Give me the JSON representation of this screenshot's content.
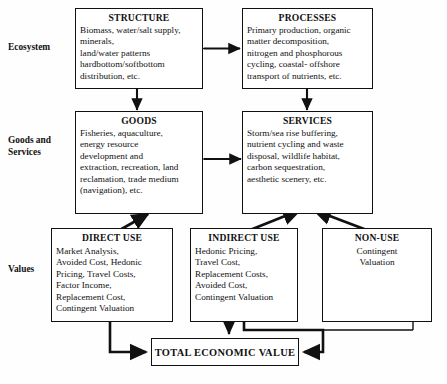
{
  "diagram": {
    "row_labels": [
      {
        "id": "ecosystem",
        "text": "Ecosystem"
      },
      {
        "id": "goods-and-services",
        "line1": "Goods and",
        "line2": "Services"
      },
      {
        "id": "values",
        "text": "Values"
      }
    ],
    "boxes": [
      {
        "id": "structure",
        "title": "STRUCTURE",
        "body": "Biomass, water/salt supply, minerals, land/water patterns hardbottom/softbottom distribution, etc.",
        "lines": [
          "Biomass, water/salt supply,",
          "minerals,",
          "land/water patterns",
          "hardbottom/softbottom",
          "distribution, etc."
        ],
        "align": "left"
      },
      {
        "id": "processes",
        "title": "PROCESSES",
        "body": "Primary production, organic matter decomposition, nitrogen and phosphorous cycling, coastal- offshore transport of nutrients, etc.",
        "lines": [
          "Primary production, organic",
          "matter decomposition,",
          "nitrogen and phosphorous",
          "cycling, coastal- offshore",
          "transport of nutrients, etc."
        ],
        "align": "left"
      },
      {
        "id": "goods",
        "title": "GOODS",
        "body": "Fisheries, aquaculture, energy resource development and extraction, recreation, land reclamation, trade medium (navigation), etc.",
        "lines": [
          "Fisheries, aquaculture,",
          "energy resource",
          "development and",
          "extraction, recreation, land",
          "reclamation, trade medium",
          "(navigation), etc."
        ],
        "align": "left"
      },
      {
        "id": "services",
        "title": "SERVICES",
        "body": "Storm/sea rise buffering, nutrient cycling and waste disposal, wildlife habitat, carbon sequestration, aesthetic scenery, etc.",
        "lines": [
          "Storm/sea rise buffering,",
          "nutrient cycling and waste",
          "disposal, wildlife habitat,",
          "carbon sequestration,",
          "aesthetic scenery, etc."
        ],
        "align": "left"
      },
      {
        "id": "direct-use",
        "title": "DIRECT USE",
        "body": "Market Analysis, Avoided Cost, Hedonic Pricing, Travel Costs, Factor Income, Replacement Cost, Contingent Valuation",
        "lines": [
          "Market Analysis,",
          "Avoided Cost, Hedonic",
          "Pricing, Travel Costs,",
          "Factor Income,",
          "Replacement Cost,",
          "Contingent Valuation"
        ],
        "align": "left"
      },
      {
        "id": "indirect-use",
        "title": "INDIRECT USE",
        "body": "Hedonic Pricing, Travel Cost, Replacement Costs, Avoided Cost, Contingent Valuation",
        "lines": [
          "Hedonic Pricing,",
          "Travel Cost,",
          "Replacement Costs,",
          "Avoided Cost,",
          "Contingent Valuation"
        ],
        "align": "left"
      },
      {
        "id": "non-use",
        "title": "NON-USE",
        "body": "Contingent Valuation",
        "lines": [
          "Contingent",
          "Valuation"
        ],
        "align": "center"
      }
    ],
    "total_box": {
      "id": "total-economic-value",
      "label": "TOTAL ECONOMIC VALUE"
    },
    "connectors": [
      {
        "id": "structure-processes",
        "kind": "double-arrow-horizontal",
        "from": "structure",
        "to": "processes"
      },
      {
        "id": "goods-services",
        "kind": "double-arrow-horizontal",
        "from": "goods",
        "to": "services"
      },
      {
        "id": "structure-goods",
        "kind": "arrow-down",
        "from": "structure",
        "to": "goods"
      },
      {
        "id": "processes-services",
        "kind": "arrow-down",
        "from": "processes",
        "to": "services"
      },
      {
        "id": "direct-use-goods",
        "kind": "arrow-diagonal-up",
        "from": "direct-use",
        "to": "goods"
      },
      {
        "id": "indirect-use-services",
        "kind": "arrow-diagonal-up",
        "from": "indirect-use",
        "to": "services"
      },
      {
        "id": "non-use-services",
        "kind": "arrow-diagonal-up",
        "from": "non-use",
        "to": "services"
      },
      {
        "id": "direct-use-total",
        "kind": "elbow-arrow-right",
        "from": "direct-use",
        "to": "total-economic-value"
      },
      {
        "id": "indirect-use-total",
        "kind": "arrow-down",
        "from": "indirect-use",
        "to": "total-economic-value"
      },
      {
        "id": "non-use-total",
        "kind": "elbow-arrow-left",
        "from": "non-use",
        "to": "total-economic-value"
      }
    ],
    "colors": {
      "line": "#111111",
      "box_border": "#111111",
      "background": "#ffffff",
      "text": "#111111"
    }
  }
}
